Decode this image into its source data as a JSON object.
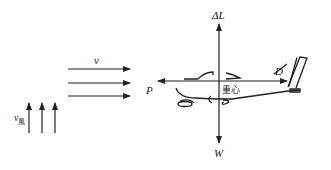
{
  "diagram": {
    "title": "",
    "labels": {
      "wind_velocity": "v",
      "updraft_velocity": "v",
      "updraft_velocity_sub": "風",
      "lift_increment": "ΔL",
      "drag": "D",
      "thrust": "P",
      "weight": "W",
      "center_of_gravity": "重心"
    },
    "colors": {
      "stroke": "#222222",
      "background": "#ffffff"
    }
  }
}
